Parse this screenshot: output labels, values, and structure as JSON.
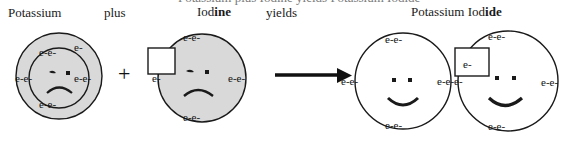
{
  "diagram": {
    "title_clipped": "Potassium plus Iodine yields Potassium Iodide",
    "labels": {
      "reactant1": "Potassium",
      "operator_word": "plus",
      "reactant2_plain": "Iod",
      "reactant2_bold": "ine",
      "yields_word": "yields",
      "product_plain": "Potassium Iod",
      "product_bold": "ide",
      "plus_sign": "+"
    },
    "electron_label": "e-",
    "electron_pair_label": "e-e-",
    "electron_triple_label": "e-e-e-",
    "colors": {
      "atom_fill_reactant": "#d9d9d9",
      "atom_fill_product": "#ffffff",
      "stroke": "#1a1a1a",
      "text": "#1a1a1a"
    },
    "atoms": [
      {
        "name": "potassium-reactant",
        "face": "sad",
        "fill": "gray",
        "shells": 2,
        "valence_electrons": 1,
        "inner_shell_pairs": 4
      },
      {
        "name": "iodine-reactant",
        "face": "sad",
        "fill": "gray",
        "shells": 1,
        "vacancy_box": "empty",
        "valence_electrons": 7
      },
      {
        "name": "potassium-product",
        "face": "happy",
        "fill": "white",
        "shells": 1,
        "valence_electrons": 8
      },
      {
        "name": "iodine-product",
        "face": "happy",
        "fill": "white",
        "shells": 1,
        "vacancy_box": "filled",
        "valence_electrons": 8
      }
    ],
    "arrow": {
      "name": "reaction-arrow",
      "direction": "right"
    }
  }
}
